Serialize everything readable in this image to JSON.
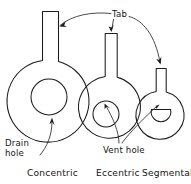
{
  "diagram": {
    "background_color": "#ffffff",
    "line_color": "#1c1c1c",
    "callouts": {
      "tab": "Tab",
      "drain_hole_line1": "Drain",
      "drain_hole_line2": "hole",
      "vent_hole": "Vent hole"
    },
    "captions": {
      "concentric": "Concentric",
      "eccentric": "Eccentric",
      "segmental": "Segmental"
    },
    "plates": [
      {
        "name": "concentric",
        "caption": "Concentric",
        "body_cx": 49,
        "body_cy": 98,
        "body_r": 41,
        "tab_x": 42,
        "tab_y": 11,
        "tab_w": 17,
        "tab_h": 50,
        "hole_type": "circle",
        "hole_cx": 49,
        "hole_cy": 97,
        "hole_r": 18,
        "hole_label": "Drain hole"
      },
      {
        "name": "eccentric",
        "caption": "Eccentric",
        "body_cx": 111,
        "body_cy": 104,
        "body_r": 31,
        "tab_x": 105,
        "tab_y": 33,
        "tab_w": 12,
        "tab_h": 42,
        "hole_type": "circle",
        "hole_cx": 106,
        "hole_cy": 114,
        "hole_r": 13,
        "hole_label": "Vent hole"
      },
      {
        "name": "segmental",
        "caption": "Segmental",
        "body_cx": 161,
        "body_cy": 112,
        "body_r": 24,
        "tab_x": 156,
        "tab_y": 68,
        "tab_w": 10,
        "tab_h": 32,
        "hole_type": "segment",
        "hole_cx": 161,
        "hole_cy": 113,
        "hole_r": 11,
        "hole_label": "Vent hole"
      }
    ]
  }
}
